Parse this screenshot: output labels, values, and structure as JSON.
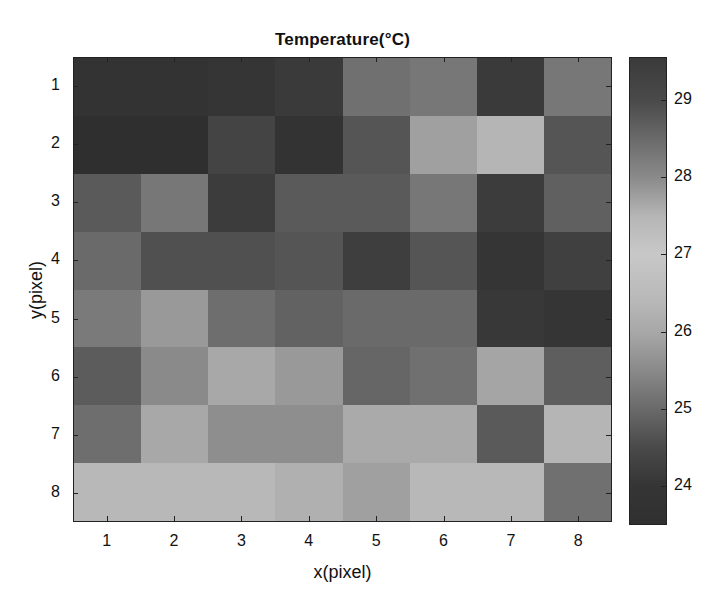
{
  "chart_data": {
    "type": "heatmap",
    "title": "Temperature(°C)",
    "xlabel": "x(pixel)",
    "ylabel": "y(pixel)",
    "x_ticks": [
      "1",
      "2",
      "3",
      "4",
      "5",
      "6",
      "7",
      "8"
    ],
    "y_ticks": [
      "1",
      "2",
      "3",
      "4",
      "5",
      "6",
      "7",
      "8"
    ],
    "colorbar": {
      "ticks": [
        "29",
        "28",
        "27",
        "26",
        "25",
        "24"
      ],
      "range": [
        23.5,
        29.55
      ],
      "colormap": "grayscale-rendered jet (dark at both extremes, light near 27)",
      "stops": [
        {
          "value": 29.55,
          "color": "#3a3a3a"
        },
        {
          "value": 29.0,
          "color": "#4a4a4a"
        },
        {
          "value": 28.5,
          "color": "#6a6a6a"
        },
        {
          "value": 28.0,
          "color": "#8a8a8a"
        },
        {
          "value": 27.5,
          "color": "#b5b5b5"
        },
        {
          "value": 27.0,
          "color": "#c8c8c8"
        },
        {
          "value": 26.4,
          "color": "#b8b8b8"
        },
        {
          "value": 26.0,
          "color": "#a8a8a8"
        },
        {
          "value": 25.5,
          "color": "#8a8a8a"
        },
        {
          "value": 25.0,
          "color": "#6a6a6a"
        },
        {
          "value": 24.5,
          "color": "#4a4a4a"
        },
        {
          "value": 24.0,
          "color": "#353535"
        },
        {
          "value": 23.5,
          "color": "#303030"
        }
      ]
    },
    "rows": [
      {
        "y": 1,
        "values": [
          29.4,
          29.4,
          29.4,
          29.3,
          28.4,
          28.3,
          29.3,
          28.3
        ],
        "colors": [
          "#333333",
          "#333333",
          "#353535",
          "#3a3a3a",
          "#707070",
          "#777777",
          "#3a3a3a",
          "#777777"
        ]
      },
      {
        "y": 2,
        "values": [
          29.5,
          29.5,
          29.1,
          29.4,
          28.8,
          27.8,
          27.5,
          28.8
        ],
        "colors": [
          "#2f2f2f",
          "#2f2f2f",
          "#444444",
          "#333333",
          "#555555",
          "#a0a0a0",
          "#b5b5b5",
          "#555555"
        ]
      },
      {
        "y": 3,
        "values": [
          28.8,
          28.3,
          29.2,
          28.8,
          28.8,
          28.3,
          24.1,
          28.6
        ],
        "colors": [
          "#5a5a5a",
          "#777777",
          "#3c3c3c",
          "#5a5a5a",
          "#5a5a5a",
          "#777777",
          "#3c3c3c",
          "#606060"
        ]
      },
      {
        "y": 4,
        "values": [
          28.5,
          28.9,
          28.9,
          28.8,
          24.2,
          28.8,
          24.0,
          24.3
        ],
        "colors": [
          "#6a6a6a",
          "#505050",
          "#505050",
          "#555555",
          "#3e3e3e",
          "#555555",
          "#353535",
          "#404040"
        ]
      },
      {
        "y": 5,
        "values": [
          28.2,
          27.9,
          28.4,
          28.6,
          28.5,
          28.5,
          24.1,
          24.0
        ],
        "colors": [
          "#7a7a7a",
          "#999999",
          "#6e6e6e",
          "#626262",
          "#6a6a6a",
          "#6a6a6a",
          "#383838",
          "#353535"
        ]
      },
      {
        "y": 6,
        "values": [
          25.1,
          25.7,
          26.0,
          25.9,
          25.0,
          25.2,
          26.0,
          25.0
        ],
        "colors": [
          "#5c5c5c",
          "#8a8a8a",
          "#a8a8a8",
          "#999999",
          "#666666",
          "#707070",
          "#a5a5a5",
          "#5e5e5e"
        ]
      },
      {
        "y": 7,
        "values": [
          25.2,
          26.0,
          25.6,
          25.6,
          26.0,
          26.0,
          24.9,
          26.3
        ],
        "colors": [
          "#6e6e6e",
          "#a8a8a8",
          "#8e8e8e",
          "#8e8e8e",
          "#aaaaaa",
          "#aaaaaa",
          "#5a5a5a",
          "#b5b5b5"
        ]
      },
      {
        "y": 8,
        "values": [
          26.4,
          26.4,
          26.4,
          26.2,
          25.9,
          26.4,
          26.4,
          25.2
        ],
        "colors": [
          "#b8b8b8",
          "#b8b8b8",
          "#b8b8b8",
          "#b0b0b0",
          "#a0a0a0",
          "#b8b8b8",
          "#b8b8b8",
          "#707070"
        ]
      }
    ],
    "note": "Values estimated from grayscale; colorbar is dark at both extremes so high/low assignment is inferred."
  }
}
